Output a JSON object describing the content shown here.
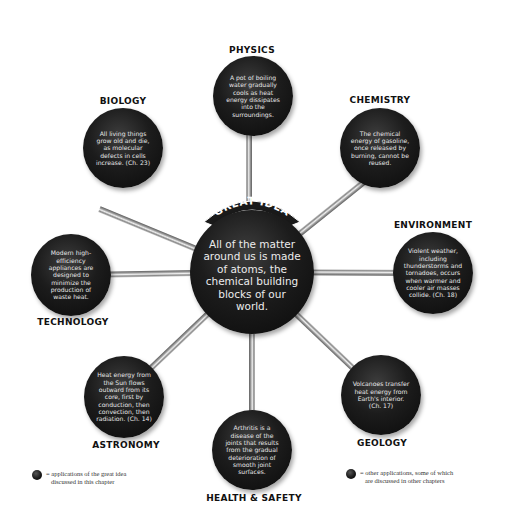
{
  "diagram": {
    "banner": {
      "label": "GREAT IDEA"
    },
    "center": {
      "text": "All of the matter around us is made of atoms, the chemical building blocks of our world."
    },
    "nodes": [
      {
        "id": "physics",
        "label": "PHYSICS",
        "text": "A pot of boiling water gradually cools as heat energy dissipates into the surroundings."
      },
      {
        "id": "biology",
        "label": "BIOLOGY",
        "text": "All living things grow old and die, as molecular defects in cells increase. (Ch. 23)"
      },
      {
        "id": "chemistry",
        "label": "CHEMISTRY",
        "text": "The chemical energy of gasoline, once released by burning, cannot be reused."
      },
      {
        "id": "environment",
        "label": "ENVIRONMENT",
        "text": "Violent weather, including thunderstorms and tornadoes, occurs when warmer and cooler air masses collide. (Ch. 18)"
      },
      {
        "id": "technology",
        "label": "TECHNOLOGY",
        "text": "Modern high-efficiency appliances are designed to minimize the production of waste heat."
      },
      {
        "id": "astronomy",
        "label": "ASTRONOMY",
        "text": "Heat energy from the Sun flows outward from its core, first by conduction, then convection, then radiation. (Ch. 14)"
      },
      {
        "id": "health-safety",
        "label": "HEALTH & SAFETY",
        "text": "Arthritis is a disease of the joints that results from the gradual deterioration of smooth joint surfaces."
      },
      {
        "id": "geology",
        "label": "GEOLOGY",
        "text": "Volcanoes transfer heat energy from Earth's interior. (Ch. 17)"
      }
    ]
  },
  "legend": {
    "left": {
      "line1": "= applications of the great idea",
      "line2": "discussed in this chapter"
    },
    "right": {
      "line1": "= other applications, some of which",
      "line2": "are discussed in other chapters"
    }
  },
  "colors": {
    "node_fill": "#111111",
    "node_text": "#e8e8e8",
    "label_text": "#111111",
    "spoke": "#9a9a9a",
    "background": "#ffffff"
  }
}
